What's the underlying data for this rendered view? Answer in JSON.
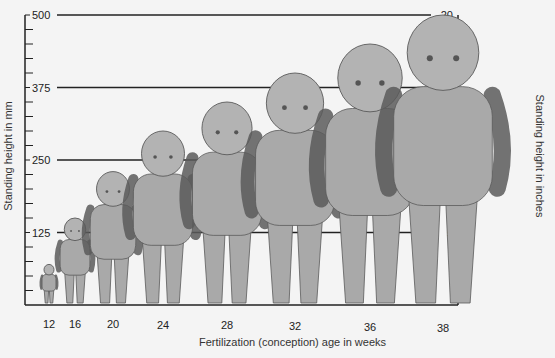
{
  "chart_data": {
    "type": "bar",
    "title": "",
    "xlabel": "Fertilization (conception) age in weeks",
    "ylabel": "Standing height in mm",
    "ylabel_right": "Standing height in inches",
    "ylim": [
      0,
      500
    ],
    "ylim_right": [
      0,
      20
    ],
    "yticks_left": [
      125,
      250,
      375,
      500
    ],
    "yticks_right": [
      5,
      10,
      15,
      20
    ],
    "grid": true,
    "legend": "none",
    "categories": [
      "12",
      "16",
      "20",
      "24",
      "28",
      "32",
      "36",
      "38"
    ],
    "series": [
      {
        "name": "Fetal standing height (mm)",
        "values": [
          70,
          150,
          230,
          300,
          350,
          400,
          450,
          500
        ]
      }
    ],
    "note": "Bars are depicted as illustrated fetus figures standing on the baseline; heights estimated from figure tops against axis gridlines."
  },
  "colors": {
    "background": "#f4f4f4",
    "axis": "#222222",
    "figure_fill": "#a9a9a9",
    "figure_stroke": "#5a5a5a"
  }
}
